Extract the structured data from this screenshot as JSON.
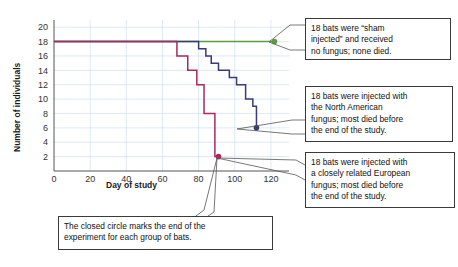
{
  "chart_data": {
    "type": "line",
    "title": "",
    "xlabel": "Day of study",
    "ylabel": "Number of individuals",
    "xlim": [
      0,
      130
    ],
    "ylim": [
      0,
      21
    ],
    "xticks": [
      0,
      20,
      40,
      60,
      80,
      100,
      120
    ],
    "yticks": [
      2,
      4,
      6,
      8,
      10,
      12,
      14,
      16,
      18,
      20
    ],
    "grid": true,
    "legend_position": "none",
    "marker_note": "closed circle marks end of experiment",
    "series": [
      {
        "name": "Sham injected (control)",
        "color": "#5c9e3f",
        "end_marker": {
          "x": 122,
          "y": 18
        },
        "points": [
          {
            "x": 0,
            "y": 18
          },
          {
            "x": 122,
            "y": 18
          }
        ]
      },
      {
        "name": "North American fungus",
        "color": "#3b3a78",
        "end_marker": {
          "x": 112,
          "y": 6
        },
        "points": [
          {
            "x": 0,
            "y": 18
          },
          {
            "x": 80,
            "y": 18
          },
          {
            "x": 80,
            "y": 17
          },
          {
            "x": 84,
            "y": 17
          },
          {
            "x": 84,
            "y": 16
          },
          {
            "x": 87,
            "y": 16
          },
          {
            "x": 87,
            "y": 15
          },
          {
            "x": 91,
            "y": 15
          },
          {
            "x": 91,
            "y": 14
          },
          {
            "x": 97,
            "y": 14
          },
          {
            "x": 97,
            "y": 13
          },
          {
            "x": 101,
            "y": 13
          },
          {
            "x": 101,
            "y": 12
          },
          {
            "x": 106,
            "y": 12
          },
          {
            "x": 106,
            "y": 10
          },
          {
            "x": 110,
            "y": 10
          },
          {
            "x": 110,
            "y": 9
          },
          {
            "x": 112,
            "y": 9
          },
          {
            "x": 112,
            "y": 6
          }
        ]
      },
      {
        "name": "European fungus",
        "color": "#a62a63",
        "end_marker": {
          "x": 91,
          "y": 2
        },
        "points": [
          {
            "x": 0,
            "y": 18
          },
          {
            "x": 68,
            "y": 18
          },
          {
            "x": 68,
            "y": 16
          },
          {
            "x": 74,
            "y": 16
          },
          {
            "x": 74,
            "y": 14
          },
          {
            "x": 79,
            "y": 14
          },
          {
            "x": 79,
            "y": 12
          },
          {
            "x": 83,
            "y": 12
          },
          {
            "x": 83,
            "y": 8
          },
          {
            "x": 89,
            "y": 8
          },
          {
            "x": 89,
            "y": 2
          },
          {
            "x": 91,
            "y": 2
          }
        ]
      }
    ]
  },
  "callouts": {
    "sham": {
      "name": "sham-injected-annotation",
      "lines": [
        "18 bats were “sham",
        "injected” and received",
        "no fungus; none died."
      ]
    },
    "north_american": {
      "name": "north-american-fungus-annotation",
      "lines": [
        "18 bats were injected with",
        "the North American",
        "fungus; most died before",
        "the end of the study."
      ]
    },
    "european": {
      "name": "european-fungus-annotation",
      "lines": [
        "18 bats were injected with",
        "a closely related European",
        "fungus; most died before",
        "the end of the study."
      ]
    },
    "closed_circle": {
      "name": "closed-circle-annotation",
      "lines": [
        "The closed circle marks the end of the",
        "experiment for each group of bats."
      ]
    }
  },
  "colors": {
    "control_green": "#5c9e3f",
    "north_american_blue": "#3b3a78",
    "european_purple": "#a62a63",
    "axis": "#555555",
    "grid": "#cfe0f0",
    "callout_border": "#3a3a3a"
  }
}
